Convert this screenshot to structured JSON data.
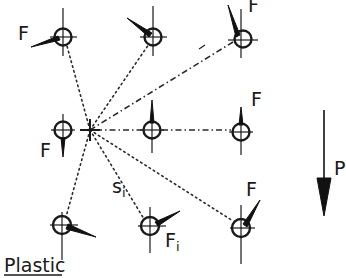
{
  "diagram": {
    "type": "fastener-group-force-distribution",
    "material_label": "Plastic",
    "centroid_label": "+",
    "load": {
      "label": "P",
      "direction": "down"
    },
    "distance_label": "s",
    "distance_subscript": "i",
    "force_label": "F",
    "force_i_label": "F",
    "force_i_subscript": "i",
    "labels": {
      "f_top_left": "F",
      "f_top_right": "F",
      "f_mid_left": "F",
      "f_mid_right": "F",
      "f_bottom_right": "F"
    },
    "fasteners": [
      {
        "id": "top-left",
        "x": 63,
        "y": 37
      },
      {
        "id": "top-middle",
        "x": 153,
        "y": 37
      },
      {
        "id": "top-right",
        "x": 241,
        "y": 37
      },
      {
        "id": "middle-left",
        "x": 63,
        "y": 130
      },
      {
        "id": "middle-middle",
        "x": 152,
        "y": 130
      },
      {
        "id": "middle-right",
        "x": 241,
        "y": 130
      },
      {
        "id": "bottom-left",
        "x": 62,
        "y": 226
      },
      {
        "id": "bottom-middle",
        "x": 150,
        "y": 226
      },
      {
        "id": "bottom-right",
        "x": 241,
        "y": 226
      }
    ],
    "colors": {
      "ink": "#1a1a1a",
      "background": "#ffffff"
    }
  }
}
